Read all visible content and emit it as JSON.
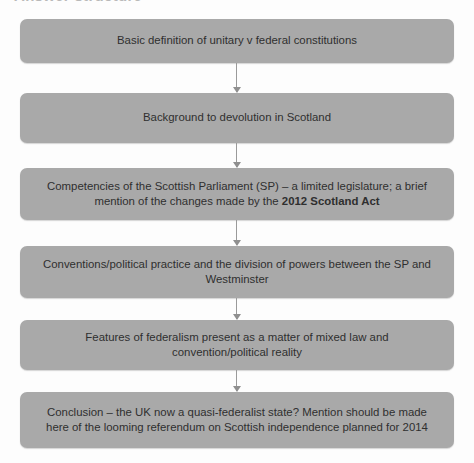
{
  "page": {
    "heading_fragment": "Answer structure",
    "background_color": "#fdfdfd"
  },
  "flowchart": {
    "node_fill_color": "#a9a9a9",
    "node_text_color": "#2f2f2f",
    "connector_color": "#9a9a9a",
    "nodes": [
      {
        "id": "node-1",
        "text": "Basic definition of unitary v federal constitutions"
      },
      {
        "id": "node-2",
        "text": "Background to devolution in Scotland"
      },
      {
        "id": "node-3",
        "text_before_bold": "Competencies of the Scottish Parliament (SP) – a limited legislature; a brief mention of the changes made by the ",
        "text_bold": "2012 Scotland Act",
        "text": "Competencies of the Scottish Parliament (SP) – a limited legislature; a brief mention of the changes made by the 2012 Scotland Act"
      },
      {
        "id": "node-4",
        "text": "Conventions/political practice and the division of powers between the SP and Westminster"
      },
      {
        "id": "node-5",
        "text": "Features of federalism present as a matter of mixed law and convention/political reality"
      },
      {
        "id": "node-6",
        "text": "Conclusion – the UK now a quasi-federalist state? Mention should be made here of the looming referendum on Scottish independence planned for 2014"
      }
    ]
  }
}
